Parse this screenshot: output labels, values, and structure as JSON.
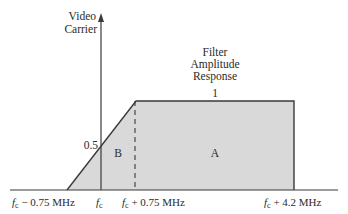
{
  "diagram": {
    "title": "Filter Amplitude Response",
    "title_lines": [
      "Filter",
      "Amplitude",
      "Response"
    ],
    "y_axis_label_lines": [
      "Video",
      "Carrier"
    ],
    "level_labels": {
      "one": "1",
      "half": "0.5"
    },
    "region_labels": {
      "a": "A",
      "b": "B"
    },
    "x_tick_labels": [
      {
        "f": "f",
        "sub": "c",
        "rest": " − 0.75 MHz"
      },
      {
        "f": "f",
        "sub": "c",
        "rest": ""
      },
      {
        "f": "f",
        "sub": "c",
        "rest": " + 0.75 MHz"
      },
      {
        "f": "f",
        "sub": "c",
        "rest": " + 4.2 MHz"
      }
    ],
    "colors": {
      "fill": "#d9d9d9",
      "stroke": "#3a3a3a",
      "text": "#2a2a2a"
    }
  }
}
